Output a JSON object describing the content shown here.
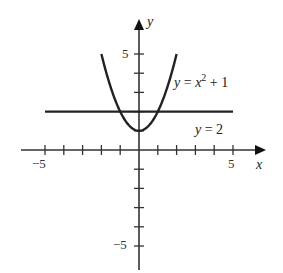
{
  "chart_data": {
    "type": "line",
    "title": "",
    "xlabel": "x",
    "ylabel": "y",
    "xlim": [
      -6,
      6.5
    ],
    "ylim": [
      -6,
      6.7
    ],
    "grid": false,
    "x_ticks": [
      -5,
      -4,
      -3,
      -2,
      -1,
      1,
      2,
      3,
      4,
      5
    ],
    "y_ticks": [
      -5,
      -4,
      -3,
      -2,
      -1,
      1,
      2,
      3,
      4,
      5
    ],
    "x_tick_labels": {
      "-5": "−5",
      "5": "5"
    },
    "y_tick_labels": {
      "5": "5",
      "-5": "−5"
    },
    "series": [
      {
        "name": "y = x² + 1",
        "equation": "y = x^2 + 1",
        "x_range": [
          -2,
          2
        ],
        "x": [
          -2,
          -1.5,
          -1,
          -0.5,
          0,
          0.5,
          1,
          1.5,
          2
        ],
        "values": [
          5,
          3.25,
          2,
          1.25,
          1,
          1.25,
          2,
          3.25,
          5
        ]
      },
      {
        "name": "y = 2",
        "equation": "y = 2",
        "x_range": [
          -5,
          5
        ],
        "x": [
          -5,
          5
        ],
        "values": [
          2,
          2
        ]
      }
    ],
    "annotations": [
      {
        "text": "y = x² + 1",
        "near": [
          1.9,
          3.3
        ]
      },
      {
        "text": "y = 2",
        "near": [
          3,
          1
        ]
      }
    ]
  },
  "labels": {
    "x_axis": "x",
    "y_axis": "y",
    "x_neg5": "−5",
    "x_pos5": "5",
    "y_pos5": "5",
    "y_neg5": "−5",
    "parabola_y": "y",
    "parabola_eq": " = ",
    "parabola_x": "x",
    "parabola_exp": "2",
    "parabola_tail": " + 1",
    "line_y": "y",
    "line_tail": " = 2"
  }
}
